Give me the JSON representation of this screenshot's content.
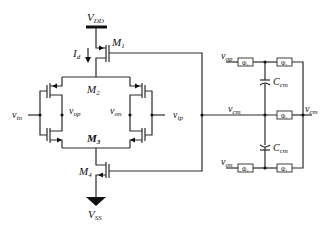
{
  "diagram": {
    "type": "circuit-schematic",
    "title": "",
    "supply": {
      "vdd": "V",
      "vdd_sub": "DD",
      "vss": "V",
      "vss_sub": "SS"
    },
    "current": {
      "label": "I",
      "sub": "d"
    },
    "transistors": [
      {
        "label": "M",
        "sub": "1"
      },
      {
        "label": "M",
        "sub": "2"
      },
      {
        "label": "M",
        "sub": "3"
      },
      {
        "label": "M",
        "sub": "4"
      }
    ],
    "nodes": {
      "vin": {
        "label": "v",
        "sub": "in"
      },
      "vip": {
        "label": "v",
        "sub": "ip"
      },
      "vop": {
        "label": "v",
        "sub": "op"
      },
      "von": {
        "label": "v",
        "sub": "on"
      },
      "vop_cmfb": {
        "label": "v",
        "sub": "op"
      },
      "von_cmfb": {
        "label": "v",
        "sub": "on"
      },
      "vcm": {
        "label": "v",
        "sub": "cm"
      },
      "vcm_ref": {
        "label": "v",
        "sub": "cm"
      }
    },
    "capacitors": [
      {
        "label": "C",
        "sub": "cm"
      },
      {
        "label": "C",
        "sub": "cm"
      }
    ],
    "switches": {
      "top_left": "Φ₂",
      "top_right": "Φ₁",
      "mid": "Φ₁",
      "bottom_left": "Φ₂",
      "bottom_right": "Φ₁"
    }
  }
}
